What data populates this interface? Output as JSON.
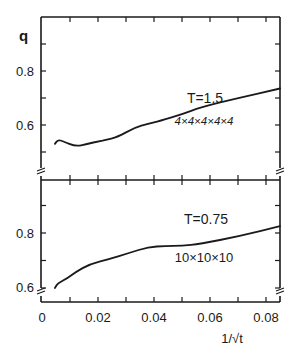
{
  "chart_data": [
    {
      "type": "line",
      "panel": "top",
      "title": "",
      "xlabel": "1/√t",
      "ylabel": "q",
      "xlim": [
        0,
        0.0845
      ],
      "ylim": [
        0.47,
        0.99
      ],
      "yticks": [
        0.5,
        0.6,
        0.7,
        0.8,
        0.9
      ],
      "ytick_labels": [
        "",
        "0.6",
        "",
        "0.8",
        ""
      ],
      "xticks": [
        0,
        0.01,
        0.02,
        0.03,
        0.04,
        0.05,
        0.06,
        0.07,
        0.08
      ],
      "grid": false,
      "axis_break": true,
      "annotations": [
        {
          "text": "T=1.5",
          "x": 0.0595,
          "y": 0.74
        },
        {
          "text": "4×4×4×4×4",
          "x": 0.0585,
          "y": 0.645
        }
      ],
      "series": [
        {
          "name": "T=1.5, 4x4x4x4x4",
          "x": [
            0.0046,
            0.0057,
            0.0075,
            0.012,
            0.016,
            0.0207,
            0.0225,
            0.027,
            0.033,
            0.038,
            0.042,
            0.05,
            0.0566,
            0.07,
            0.085
          ],
          "y": [
            0.53,
            0.545,
            0.54,
            0.52,
            0.53,
            0.54,
            0.544,
            0.555,
            0.59,
            0.605,
            0.615,
            0.64,
            0.665,
            0.7,
            0.735
          ]
        }
      ]
    },
    {
      "type": "line",
      "panel": "bottom",
      "title": "",
      "xlabel": "1/√t",
      "ylabel": "",
      "xlim": [
        0,
        0.0845
      ],
      "ylim": [
        0.595,
        0.96
      ],
      "yticks": [
        0.6,
        0.7,
        0.8,
        0.9
      ],
      "ytick_labels": [
        "0.6",
        "",
        "0.8",
        ""
      ],
      "xticks": [
        0,
        0.01,
        0.02,
        0.03,
        0.04,
        0.05,
        0.06,
        0.07,
        0.08
      ],
      "xtick_labels": [
        "0",
        "",
        "0.02",
        "",
        "0.04",
        "",
        "0.06",
        "",
        "0.08"
      ],
      "grid": false,
      "axis_break": true,
      "annotations": [
        {
          "text": "T=0.75",
          "x": 0.059,
          "y": 0.855
        },
        {
          "text": "10×10×10",
          "x": 0.058,
          "y": 0.72
        }
      ],
      "series": [
        {
          "name": "T=0.75, 10x10x10",
          "x": [
            0.0046,
            0.0057,
            0.009,
            0.012,
            0.017,
            0.024,
            0.031,
            0.038,
            0.044,
            0.05,
            0.0564,
            0.0707,
            0.085
          ],
          "y": [
            0.6,
            0.618,
            0.635,
            0.658,
            0.687,
            0.705,
            0.727,
            0.749,
            0.753,
            0.754,
            0.76,
            0.789,
            0.825
          ]
        }
      ]
    }
  ],
  "labels": {
    "y_symbol": "q",
    "x_axis": "1/√t",
    "top_temperature": "T=1.5",
    "top_lattice": "4×4×4×4×4",
    "bottom_temperature": "T=0.75",
    "bottom_lattice": "10×10×10",
    "top_y_08": "0.8",
    "top_y_06": "0.6",
    "bottom_y_08": "0.8",
    "bottom_y_06": "0.6",
    "x_0": "0",
    "x_002": "0.02",
    "x_004": "0.04",
    "x_006": "0.06",
    "x_008": "0.08"
  },
  "colors": {
    "ink": "#1a1a1a",
    "background": "#ffffff"
  }
}
